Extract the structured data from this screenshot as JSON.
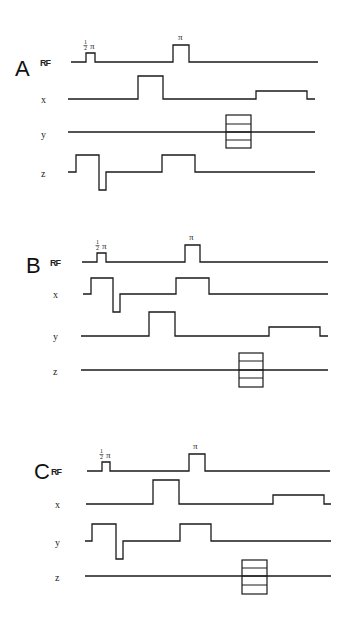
{
  "figure": {
    "width": 350,
    "height": 620,
    "background": "#ffffff",
    "ink": "#1a1a1a"
  },
  "panels": [
    {
      "id": "A",
      "letter": "A",
      "letter_pos": [
        15,
        76
      ],
      "channels": [
        {
          "name": "rf",
          "label": "RF",
          "label_pos": [
            40,
            66
          ],
          "points": [
            [
              71,
              62
            ],
            [
              86,
              62
            ],
            [
              86,
              53
            ],
            [
              95,
              53
            ],
            [
              95,
              62
            ],
            [
              173,
              62
            ],
            [
              173,
              45
            ],
            [
              189,
              45
            ],
            [
              189,
              62
            ],
            [
              318,
              62
            ]
          ],
          "pulse_labels": [
            {
              "kind": "half-pi",
              "text": "π",
              "frac": "1/2",
              "pos": [
                88,
                49
              ]
            },
            {
              "kind": "pi",
              "text": "π",
              "pos": [
                178,
                40
              ]
            }
          ]
        },
        {
          "name": "x",
          "label": "x",
          "label_pos": [
            41,
            103
          ],
          "points": [
            [
              68,
              99
            ],
            [
              138,
              99
            ],
            [
              138,
              76
            ],
            [
              163,
              76
            ],
            [
              163,
              99
            ],
            [
              256,
              99
            ],
            [
              256,
              91
            ],
            [
              307,
              91
            ],
            [
              307,
              99
            ],
            [
              315,
              99
            ]
          ]
        },
        {
          "name": "y",
          "label": "y",
          "label_pos": [
            41,
            138
          ],
          "points": [
            [
              68,
              132
            ],
            [
              315,
              132
            ]
          ],
          "phase_box": {
            "x": 226,
            "y": 115,
            "w": 25,
            "h": 33,
            "lines": [
              124,
              132,
              140
            ]
          }
        },
        {
          "name": "z",
          "label": "z",
          "label_pos": [
            41,
            177
          ],
          "points": [
            [
              68,
              172
            ],
            [
              76,
              172
            ],
            [
              76,
              155
            ],
            [
              99,
              155
            ],
            [
              99,
              190
            ],
            [
              106,
              190
            ],
            [
              106,
              172
            ],
            [
              162,
              172
            ],
            [
              162,
              155
            ],
            [
              195,
              155
            ],
            [
              195,
              172
            ],
            [
              315,
              172
            ]
          ]
        }
      ]
    },
    {
      "id": "B",
      "letter": "B",
      "letter_pos": [
        26,
        273
      ],
      "channels": [
        {
          "name": "rf",
          "label": "RF",
          "label_pos": [
            50,
            266
          ],
          "points": [
            [
              82,
              262
            ],
            [
              97,
              262
            ],
            [
              97,
              253
            ],
            [
              106,
              253
            ],
            [
              106,
              262
            ],
            [
              185,
              262
            ],
            [
              185,
              245
            ],
            [
              200,
              245
            ],
            [
              200,
              262
            ],
            [
              328,
              262
            ]
          ],
          "pulse_labels": [
            {
              "kind": "half-pi",
              "text": "π",
              "frac": "1/2",
              "pos": [
                100,
                249
              ]
            },
            {
              "kind": "pi",
              "text": "π",
              "pos": [
                189,
                240
              ]
            }
          ]
        },
        {
          "name": "x",
          "label": "x",
          "label_pos": [
            53,
            298
          ],
          "points": [
            [
              83,
              294
            ],
            [
              91,
              294
            ],
            [
              91,
              278
            ],
            [
              113,
              278
            ],
            [
              113,
              312
            ],
            [
              120,
              312
            ],
            [
              120,
              294
            ],
            [
              176,
              294
            ],
            [
              176,
              278
            ],
            [
              209,
              278
            ],
            [
              209,
              294
            ],
            [
              328,
              294
            ]
          ]
        },
        {
          "name": "y",
          "label": "y",
          "label_pos": [
            53,
            340
          ],
          "points": [
            [
              81,
              336
            ],
            [
              149,
              336
            ],
            [
              149,
              312
            ],
            [
              175,
              312
            ],
            [
              175,
              336
            ],
            [
              269,
              336
            ],
            [
              269,
              327
            ],
            [
              320,
              327
            ],
            [
              320,
              336
            ],
            [
              328,
              336
            ]
          ]
        },
        {
          "name": "z",
          "label": "z",
          "label_pos": [
            53,
            375
          ],
          "points": [
            [
              81,
              370
            ],
            [
              328,
              370
            ]
          ],
          "phase_box": {
            "x": 239,
            "y": 353,
            "w": 24,
            "h": 34,
            "lines": [
              361,
              370,
              378
            ]
          }
        }
      ]
    },
    {
      "id": "C",
      "letter": "C",
      "letter_pos": [
        34,
        479
      ],
      "channels": [
        {
          "name": "rf",
          "label": "RF",
          "label_pos": [
            51,
            475
          ],
          "points": [
            [
              87,
              471
            ],
            [
              102,
              471
            ],
            [
              102,
              462
            ],
            [
              110,
              462
            ],
            [
              110,
              471
            ],
            [
              189,
              471
            ],
            [
              189,
              454
            ],
            [
              205,
              454
            ],
            [
              205,
              471
            ],
            [
              330,
              471
            ]
          ],
          "pulse_labels": [
            {
              "kind": "half-pi",
              "text": "π",
              "frac": "1/2",
              "pos": [
                104,
                458
              ]
            },
            {
              "kind": "pi",
              "text": "π",
              "pos": [
                193,
                449
              ]
            }
          ]
        },
        {
          "name": "x",
          "label": "x",
          "label_pos": [
            55,
            508
          ],
          "points": [
            [
              86,
              504
            ],
            [
              153,
              504
            ],
            [
              153,
              480
            ],
            [
              179,
              480
            ],
            [
              179,
              504
            ],
            [
              273,
              504
            ],
            [
              273,
              495
            ],
            [
              324,
              495
            ],
            [
              324,
              504
            ],
            [
              331,
              504
            ]
          ]
        },
        {
          "name": "y",
          "label": "y",
          "label_pos": [
            55,
            546
          ],
          "points": [
            [
              85,
              541
            ],
            [
              92,
              541
            ],
            [
              92,
              524
            ],
            [
              116,
              524
            ],
            [
              116,
              559
            ],
            [
              123,
              559
            ],
            [
              123,
              541
            ],
            [
              180,
              541
            ],
            [
              180,
              524
            ],
            [
              211,
              524
            ],
            [
              211,
              541
            ],
            [
              331,
              541
            ]
          ]
        },
        {
          "name": "z",
          "label": "z",
          "label_pos": [
            55,
            581
          ],
          "points": [
            [
              85,
              576
            ],
            [
              331,
              576
            ]
          ],
          "phase_box": {
            "x": 242,
            "y": 560,
            "w": 25,
            "h": 34,
            "lines": [
              568,
              576,
              585
            ]
          }
        }
      ]
    }
  ]
}
